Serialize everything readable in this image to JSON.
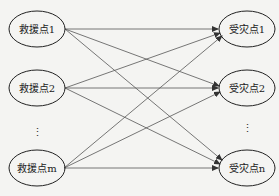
{
  "diagram": {
    "type": "bipartite-flow",
    "left_nodes": [
      {
        "label": "救援点1",
        "cx": 37,
        "cy": 29
      },
      {
        "label": "救援点2",
        "cx": 37,
        "cy": 88
      },
      {
        "label": "救援点m",
        "cx": 37,
        "cy": 168
      }
    ],
    "right_nodes": [
      {
        "label": "受灾点1",
        "cx": 247,
        "cy": 29
      },
      {
        "label": "受灾点2",
        "cx": 247,
        "cy": 88
      },
      {
        "label": "受灾点n",
        "cx": 247,
        "cy": 168
      }
    ],
    "left_ellipsis": "⋮",
    "right_ellipsis": "⋮",
    "edges": "every left node connects to every right node with an arrow",
    "colors": {
      "line": "#444444",
      "background": "#f4f4f2"
    }
  }
}
